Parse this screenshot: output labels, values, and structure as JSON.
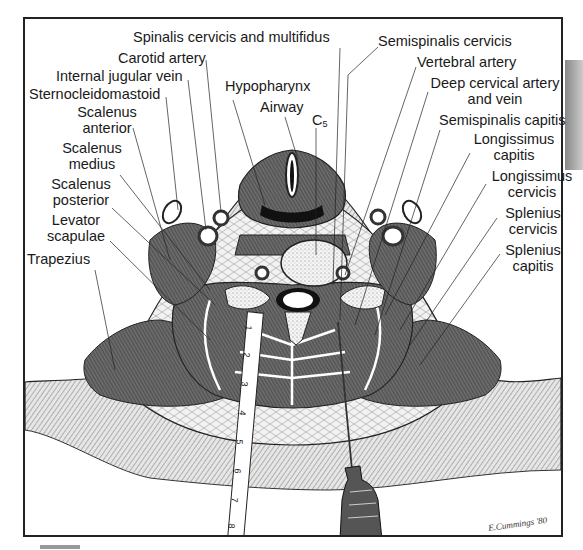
{
  "figure": {
    "signature": "E.Cummings '80"
  },
  "labels_left": [
    {
      "id": "spinalis",
      "text": "Spinalis cervicis and multifidus"
    },
    {
      "id": "carotid",
      "text": "Carotid artery"
    },
    {
      "id": "ijv",
      "text": "Internal jugular vein"
    },
    {
      "id": "scm",
      "text": "Sternocleidomastoid"
    },
    {
      "id": "scalant1",
      "text": "Scalenus"
    },
    {
      "id": "scalant2",
      "text": "anterior"
    },
    {
      "id": "scalmed1",
      "text": "Scalenus"
    },
    {
      "id": "scalmed2",
      "text": "medius"
    },
    {
      "id": "scalpost1",
      "text": "Scalenus"
    },
    {
      "id": "scalpost2",
      "text": "posterior"
    },
    {
      "id": "levator1",
      "text": "Levator"
    },
    {
      "id": "levator2",
      "text": "scapulae"
    },
    {
      "id": "trapezius",
      "text": "Trapezius"
    }
  ],
  "labels_center": [
    {
      "id": "hypopharynx",
      "text": "Hypopharynx"
    },
    {
      "id": "airway",
      "text": "Airway"
    },
    {
      "id": "c5",
      "text": "C",
      "sub": "5"
    }
  ],
  "labels_right": [
    {
      "id": "semicerv",
      "text": "Semispinalis cervicis"
    },
    {
      "id": "vertebral",
      "text": "Vertebral artery"
    },
    {
      "id": "deep1",
      "text": "Deep cervical artery"
    },
    {
      "id": "deep2",
      "text": "and vein"
    },
    {
      "id": "semicap",
      "text": "Semispinalis capitis"
    },
    {
      "id": "longcap1",
      "text": "Longissimus"
    },
    {
      "id": "longcap2",
      "text": "capitis"
    },
    {
      "id": "longcerv1",
      "text": "Longissimus"
    },
    {
      "id": "longcerv2",
      "text": "cervicis"
    },
    {
      "id": "splcerv1",
      "text": "Splenius"
    },
    {
      "id": "splcerv2",
      "text": "cervicis"
    },
    {
      "id": "splcap1",
      "text": "Splenius"
    },
    {
      "id": "splcap2",
      "text": "capitis"
    }
  ],
  "ruler": {
    "marks": [
      "1",
      "2",
      "3",
      "4",
      "5",
      "6",
      "7",
      "8"
    ]
  },
  "colors": {
    "ink": "#1a1a1a",
    "muscle": "#555555",
    "muscle_light": "#8a8a8a",
    "fat": "#d9d9d9",
    "bone": "#efefef",
    "paper": "#ffffff"
  }
}
